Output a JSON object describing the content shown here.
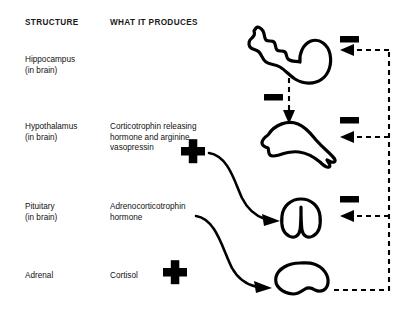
{
  "diagram": {
    "headers": {
      "structure": "STRUCTURE",
      "produces": "WHAT IT PRODUCES"
    },
    "rows": [
      {
        "structure_name": "Hippocampus",
        "structure_sub": "(in brain)",
        "produces": ""
      },
      {
        "structure_name": "Hypothalamus",
        "structure_sub": "(in brain)",
        "produces_line1": "Corticotrophin releasing",
        "produces_line2": "hormone and arginine",
        "produces_line3": "vasopressin"
      },
      {
        "structure_name": "Pituitary",
        "structure_sub": "(in brain)",
        "produces_line1": "Adrenocorticotrophin",
        "produces_line2": "hormone"
      },
      {
        "structure_name": "Adrenal",
        "structure_sub": "",
        "produces_line1": "Cortisol"
      }
    ],
    "signs": {
      "plus": "+",
      "minus": "-"
    },
    "sign_markers": [
      {
        "kind": "minus",
        "meaning": "hippocampus-inhibits-hypothalamus"
      },
      {
        "kind": "minus",
        "meaning": "cortisol-inhibits-hippocampus"
      },
      {
        "kind": "minus",
        "meaning": "cortisol-inhibits-hypothalamus"
      },
      {
        "kind": "minus",
        "meaning": "cortisol-inhibits-pituitary"
      },
      {
        "kind": "plus",
        "meaning": "crh-avp-stimulates-pituitary"
      },
      {
        "kind": "plus",
        "meaning": "acth-stimulates-adrenal"
      }
    ],
    "organs": [
      {
        "name": "hippocampus"
      },
      {
        "name": "hypothalamus"
      },
      {
        "name": "pituitary"
      },
      {
        "name": "adrenal"
      }
    ],
    "colors": {
      "ink": "#000000",
      "background": "#ffffff",
      "text": "#111111"
    }
  }
}
